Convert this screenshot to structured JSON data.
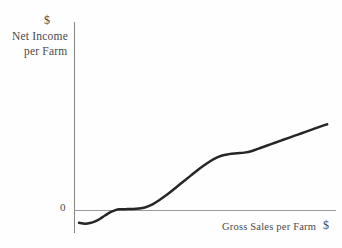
{
  "chart_data": {
    "type": "line",
    "title": "",
    "subtitle": "",
    "xlabel": "Gross Sales per Farm",
    "ylabel": "Net Income per Farm",
    "xlabel_unit": "$",
    "ylabel_unit": "$",
    "grid": false,
    "legend": null,
    "xlim": [
      0,
      100
    ],
    "ylim": [
      -12,
      72
    ],
    "xticks": [],
    "yticks": [
      0
    ],
    "ytick_labels": [
      "0"
    ],
    "annotations": [],
    "series": [
      {
        "name": "Net Income per Farm",
        "color": "#262626",
        "x": [
          1.2,
          3.5,
          5.5,
          7.5,
          9.5,
          11.5,
          13.5,
          15.5,
          17.0,
          19.5,
          22.0,
          24.5,
          27.0,
          30.0,
          33.0,
          36.0,
          39.0,
          42.0,
          45.0,
          48.0,
          51.0,
          54.0,
          57.0,
          60.0,
          63.0,
          66.0,
          69.0,
          72.0,
          75.0,
          78.0,
          81.0,
          84.0,
          87.0,
          90.0,
          93.0,
          96.0,
          98.5
        ],
        "y": [
          -9.0,
          -9.6,
          -9.2,
          -8.0,
          -6.0,
          -3.5,
          -1.2,
          0.3,
          0.9,
          1.0,
          1.1,
          1.4,
          2.2,
          4.5,
          8.0,
          12.0,
          16.5,
          21.0,
          25.5,
          30.0,
          34.0,
          37.5,
          40.0,
          41.2,
          41.8,
          42.3,
          43.5,
          45.5,
          47.5,
          49.5,
          51.5,
          53.5,
          55.5,
          57.5,
          59.5,
          61.5,
          63.0
        ]
      }
    ]
  },
  "axes": {
    "y_axis_currency": "$",
    "y_axis_label_line1": "Net Income",
    "y_axis_label_line2": "per Farm",
    "x_axis_label": "Gross Sales per Farm",
    "x_axis_currency": "$",
    "origin_label": "0"
  },
  "style": {
    "curve_color": "#262626",
    "axis_color": "#8a8a88",
    "text_color": "#4a4a48",
    "background": "#fefefe"
  }
}
